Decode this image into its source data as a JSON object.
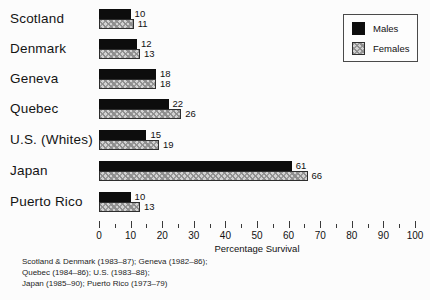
{
  "chart_data": {
    "type": "bar",
    "orientation": "horizontal",
    "title": "",
    "xlabel": "Percentage Survival",
    "xlim": [
      0,
      100
    ],
    "xticks": [
      0,
      10,
      20,
      30,
      40,
      50,
      60,
      70,
      80,
      90,
      100
    ],
    "minor_tick_step": 5,
    "grid": false,
    "legend_position": "top-right",
    "categories": [
      "Scotland",
      "Denmark",
      "Geneva",
      "Quebec",
      "U.S. (Whites)",
      "Japan",
      "Puerto Rico"
    ],
    "series": [
      {
        "name": "Males",
        "color": "#0d0d0d",
        "pattern": "solid",
        "values": [
          10,
          12,
          18,
          22,
          15,
          61,
          10
        ]
      },
      {
        "name": "Females",
        "color": "#d2d2d2",
        "pattern": "crosshatch",
        "values": [
          11,
          13,
          18,
          26,
          19,
          66,
          13
        ]
      }
    ]
  },
  "axis": {
    "title": "Percentage Survival"
  },
  "legend": {
    "males_label": "Males",
    "females_label": "Females"
  },
  "footnotes": {
    "line1": "Scotland & Denmark (1983–87); Geneva (1982–86);",
    "line2": "Quebec (1984–86); U.S. (1983–88);",
    "line3": "Japan (1985–90); Puerto Rico (1973–79)"
  }
}
